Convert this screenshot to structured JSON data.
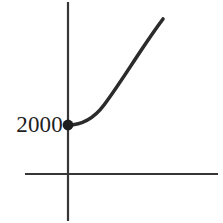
{
  "figure": {
    "width": 223,
    "height": 223,
    "background_color": "#ffffff",
    "ink_color": "#2b2b2b"
  },
  "labels": {
    "y_intercept": "2000"
  },
  "chart_data": {
    "type": "line",
    "title": "",
    "subtitle": "",
    "xlabel": "",
    "ylabel": "",
    "legend": [],
    "grid": false,
    "legend_position": "none",
    "axes": {
      "x_axis": {
        "pixel_y": 174,
        "pixel_x_start": 25,
        "pixel_x_end": 218,
        "tick_labels": [],
        "arrowheads": false
      },
      "y_axis": {
        "pixel_x": 68,
        "pixel_y_start": 2,
        "pixel_y_end": 221,
        "tick_labels": [
          "2000"
        ],
        "arrowheads": false
      }
    },
    "annotations": [
      {
        "text": "2000",
        "kind": "y-intercept-label",
        "pixel_x": 40,
        "pixel_y": 124,
        "color": "#1f1f1f"
      }
    ],
    "markers": [
      {
        "name": "y-intercept-point",
        "pixel_x": 68,
        "pixel_y": 125,
        "radius": 5.4,
        "color": "#1d1d1d",
        "value_label": "2000"
      }
    ],
    "series": [
      {
        "name": "growth-curve",
        "color": "#2b2b2b",
        "stroke_width": 3.6,
        "points_pixel": [
          [
            68,
            125
          ],
          [
            80,
            123
          ],
          [
            92,
            118
          ],
          [
            101,
            110
          ],
          [
            110,
            99
          ],
          [
            120,
            84
          ],
          [
            131,
            67
          ],
          [
            143,
            48
          ],
          [
            154,
            31
          ],
          [
            163,
            19
          ]
        ],
        "path_d": "M 68 125 C 84 125 95 117 104 105 C 116 89 128 70 140 52 C 150 37 157 27 163 19"
      }
    ]
  }
}
